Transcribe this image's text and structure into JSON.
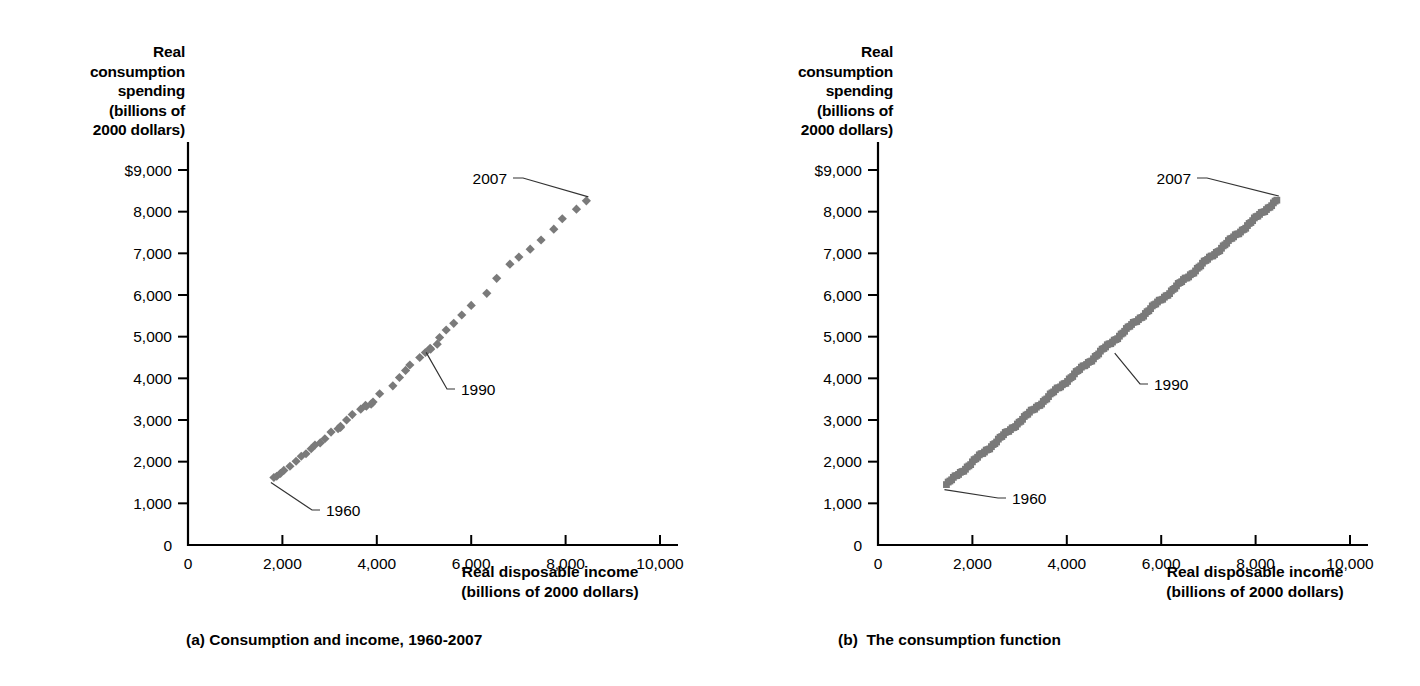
{
  "figure": {
    "marker_color": "#7a7a7a",
    "axis_color": "#000000"
  },
  "panel_a": {
    "caption": "(a) Consumption and income, 1960-2007",
    "y_axis_title": "Real\nconsumption\nspending\n(billions of\n2000 dollars)",
    "x_axis_title": "Real disposable income\n(billions of 2000 dollars)",
    "y_ticks": [
      "$9,000",
      "8,000",
      "7,000",
      "6,000",
      "5,000",
      "4,000",
      "3,000",
      "2,000",
      "1,000",
      "0"
    ],
    "x_ticks": [
      "0",
      "2,000",
      "4,000",
      "6,000",
      "8,000",
      "10,000"
    ],
    "annotations": [
      {
        "label": "2007"
      },
      {
        "label": "1990"
      },
      {
        "label": "1960"
      }
    ]
  },
  "panel_b": {
    "caption": "(b)  The consumption function",
    "y_axis_title": "Real\nconsumption\nspending\n(billions of\n2000 dollars)",
    "x_axis_title": "Real disposable income\n(billions of 2000 dollars)",
    "y_ticks": [
      "$9,000",
      "8,000",
      "7,000",
      "6,000",
      "5,000",
      "4,000",
      "3,000",
      "2,000",
      "1,000",
      "0"
    ],
    "x_ticks": [
      "0",
      "2,000",
      "4,000",
      "6,000",
      "8,000",
      "10,000"
    ],
    "annotations": [
      {
        "label": "2007"
      },
      {
        "label": "1990"
      },
      {
        "label": "1960"
      }
    ]
  },
  "chart_data": [
    {
      "type": "scatter",
      "title": "(a) Consumption and income, 1960-2007",
      "xlabel": "Real disposable income (billions of 2000 dollars)",
      "ylabel": "Real consumption spending (billions of 2000 dollars)",
      "xlim": [
        0,
        10000
      ],
      "ylim": [
        0,
        9000
      ],
      "xticks": [
        0,
        2000,
        4000,
        6000,
        8000,
        10000
      ],
      "yticks": [
        0,
        1000,
        2000,
        3000,
        4000,
        5000,
        6000,
        7000,
        8000,
        9000
      ],
      "grid": false,
      "legend": "none",
      "marker": "diamond",
      "series": [
        {
          "name": "Annual consumption vs disposable income",
          "points": [
            {
              "year": 1960,
              "x": 1820,
              "y": 1620
            },
            {
              "year": 1961,
              "x": 1880,
              "y": 1650
            },
            {
              "year": 1962,
              "x": 1960,
              "y": 1720
            },
            {
              "year": 1963,
              "x": 2030,
              "y": 1790
            },
            {
              "year": 1964,
              "x": 2160,
              "y": 1890
            },
            {
              "year": 1965,
              "x": 2290,
              "y": 2010
            },
            {
              "year": 1966,
              "x": 2400,
              "y": 2130
            },
            {
              "year": 1967,
              "x": 2500,
              "y": 2190
            },
            {
              "year": 1968,
              "x": 2610,
              "y": 2310
            },
            {
              "year": 1969,
              "x": 2690,
              "y": 2400
            },
            {
              "year": 1970,
              "x": 2800,
              "y": 2450
            },
            {
              "year": 1971,
              "x": 2900,
              "y": 2550
            },
            {
              "year": 1972,
              "x": 3030,
              "y": 2710
            },
            {
              "year": 1973,
              "x": 3230,
              "y": 2820
            },
            {
              "year": 1974,
              "x": 3180,
              "y": 2790
            },
            {
              "year": 1975,
              "x": 3230,
              "y": 2850
            },
            {
              "year": 1976,
              "x": 3360,
              "y": 3000
            },
            {
              "year": 1977,
              "x": 3480,
              "y": 3130
            },
            {
              "year": 1978,
              "x": 3660,
              "y": 3260
            },
            {
              "year": 1979,
              "x": 3760,
              "y": 3350
            },
            {
              "year": 1980,
              "x": 3780,
              "y": 3330
            },
            {
              "year": 1981,
              "x": 3880,
              "y": 3380
            },
            {
              "year": 1982,
              "x": 3920,
              "y": 3430
            },
            {
              "year": 1983,
              "x": 4060,
              "y": 3630
            },
            {
              "year": 1984,
              "x": 4340,
              "y": 3820
            },
            {
              "year": 1985,
              "x": 4480,
              "y": 4020
            },
            {
              "year": 1986,
              "x": 4610,
              "y": 4190
            },
            {
              "year": 1987,
              "x": 4700,
              "y": 4320
            },
            {
              "year": 1988,
              "x": 4910,
              "y": 4500
            },
            {
              "year": 1989,
              "x": 5030,
              "y": 4620
            },
            {
              "year": 1990,
              "x": 5130,
              "y": 4720
            },
            {
              "year": 1991,
              "x": 5140,
              "y": 4700
            },
            {
              "year": 1992,
              "x": 5280,
              "y": 4820
            },
            {
              "year": 1993,
              "x": 5330,
              "y": 4980
            },
            {
              "year": 1994,
              "x": 5470,
              "y": 5160
            },
            {
              "year": 1995,
              "x": 5630,
              "y": 5320
            },
            {
              "year": 1996,
              "x": 5800,
              "y": 5520
            },
            {
              "year": 1997,
              "x": 6000,
              "y": 5750
            },
            {
              "year": 1998,
              "x": 6330,
              "y": 6040
            },
            {
              "year": 1999,
              "x": 6540,
              "y": 6400
            },
            {
              "year": 2000,
              "x": 6820,
              "y": 6740
            },
            {
              "year": 2001,
              "x": 7010,
              "y": 6910
            },
            {
              "year": 2002,
              "x": 7250,
              "y": 7100
            },
            {
              "year": 2003,
              "x": 7480,
              "y": 7320
            },
            {
              "year": 2004,
              "x": 7750,
              "y": 7580
            },
            {
              "year": 2005,
              "x": 7930,
              "y": 7830
            },
            {
              "year": 2006,
              "x": 8230,
              "y": 8060
            },
            {
              "year": 2007,
              "x": 8440,
              "y": 8260
            }
          ]
        }
      ],
      "annotations": [
        {
          "label": "2007",
          "x": 8440,
          "y": 8260
        },
        {
          "label": "1990",
          "x": 5130,
          "y": 4720
        },
        {
          "label": "1960",
          "x": 1820,
          "y": 1620
        }
      ]
    },
    {
      "type": "scatter",
      "title": "(b)  The consumption function",
      "xlabel": "Real disposable income (billions of 2000 dollars)",
      "ylabel": "Real consumption spending (billions of 2000 dollars)",
      "xlim": [
        0,
        10000
      ],
      "ylim": [
        0,
        9000
      ],
      "xticks": [
        0,
        2000,
        4000,
        6000,
        8000,
        10000
      ],
      "yticks": [
        0,
        1000,
        2000,
        3000,
        4000,
        5000,
        6000,
        7000,
        8000,
        9000
      ],
      "grid": false,
      "legend": "none",
      "marker": "square",
      "series": [
        {
          "name": "Quarterly consumption vs disposable income",
          "x_start": 1450,
          "y_start": 1450,
          "x_end": 8450,
          "y_end": 8280,
          "n_points": 192,
          "description": "Dense quarterly observations 1960Q1-2007Q4 forming a near-linear band"
        }
      ],
      "annotations": [
        {
          "label": "2007",
          "x": 8450,
          "y": 8280
        },
        {
          "label": "1990",
          "x": 5100,
          "y": 4700
        },
        {
          "label": "1960",
          "x": 1450,
          "y": 1450
        }
      ]
    }
  ]
}
